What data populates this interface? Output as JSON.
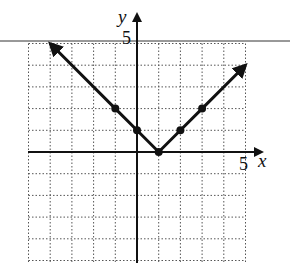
{
  "chart_data": {
    "type": "line",
    "title": "",
    "function": "y = |x - 1|",
    "xlabel": "x",
    "ylabel": "y",
    "xlim": [
      -5,
      5
    ],
    "ylim": [
      -5,
      5
    ],
    "grid": true,
    "grid_style": "dotted",
    "tick_labels": {
      "x": [
        "5"
      ],
      "y": [
        "5"
      ]
    },
    "series": [
      {
        "name": "absolute value graph",
        "x": [
          -4,
          -1,
          0,
          1,
          2,
          3,
          5
        ],
        "y": [
          5,
          2,
          1,
          0,
          1,
          2,
          4
        ],
        "marked_points": [
          [
            -1,
            2
          ],
          [
            0,
            1
          ],
          [
            1,
            0
          ],
          [
            2,
            1
          ],
          [
            3,
            2
          ]
        ],
        "arrows_at_ends": true
      }
    ]
  },
  "labels": {
    "x_axis": "x",
    "y_axis": "y",
    "x_tick": "5",
    "y_tick": "5"
  },
  "colors": {
    "ink": "#111111",
    "grid": "#555555",
    "background": "#ffffff"
  }
}
